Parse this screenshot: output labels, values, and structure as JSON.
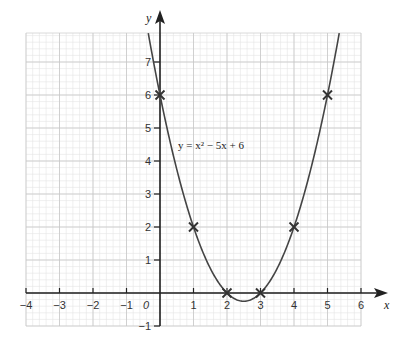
{
  "chart_data": {
    "type": "line",
    "title": "",
    "xlabel": "x",
    "ylabel": "y",
    "xlim": [
      -4,
      6
    ],
    "ylim": [
      -1,
      8
    ],
    "grid": true,
    "x_ticks": [
      -4,
      -3,
      -2,
      -1,
      0,
      1,
      2,
      3,
      4,
      5,
      6
    ],
    "x_tick_labels": [
      "−4",
      "−3",
      "−2",
      "−1",
      "0",
      "1",
      "2",
      "3",
      "4",
      "5",
      "6"
    ],
    "y_ticks": [
      -1,
      1,
      2,
      3,
      4,
      5,
      6,
      7
    ],
    "y_tick_labels": [
      "−1",
      "1",
      "2",
      "3",
      "4",
      "5",
      "6",
      "7"
    ],
    "annotations": [
      {
        "text": "y = x² − 5x + 6",
        "x": 0.6,
        "y": 4.4
      }
    ],
    "series": [
      {
        "name": "y = x² − 5x + 6",
        "function": "x^2 - 5x + 6",
        "domain": [
          -0.35,
          5.35
        ],
        "color": "#444444"
      },
      {
        "name": "plotted points",
        "marker": "x",
        "x": [
          0,
          1,
          2,
          3,
          4,
          5
        ],
        "y": [
          6,
          2,
          0,
          0,
          2,
          6
        ]
      }
    ]
  },
  "labels": {
    "x_axis": "x",
    "y_axis": "y",
    "equation": "y = x² − 5x + 6"
  }
}
